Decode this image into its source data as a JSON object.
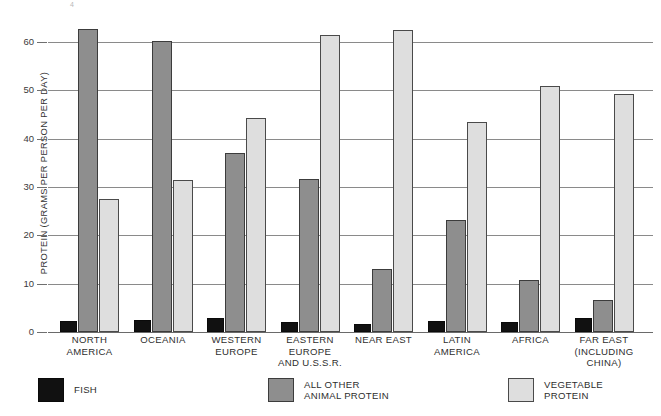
{
  "chart_data": {
    "type": "bar",
    "title": "",
    "subtitle": "",
    "xlabel": "",
    "ylabel": "PROTEIN (GRAMS PER PERSON PER DAY)",
    "ylim": [
      0,
      65
    ],
    "yticks": [
      0,
      10,
      20,
      30,
      40,
      50,
      60
    ],
    "ytick_labels": [
      "0",
      "10",
      "20",
      "30",
      "40",
      "50",
      "60"
    ],
    "grid": true,
    "legend_position": "bottom-left",
    "categories": [
      "NORTH\nAMERICA",
      "OCEANIA",
      "WESTERN\nEUROPE",
      "EASTERN\nEUROPE\nAND U.S.S.R.",
      "NEAR EAST",
      "LATIN\nAMERICA",
      "AFRICA",
      "FAR EAST\n(INCLUDING\nCHINA)"
    ],
    "series": [
      {
        "name": "FISH",
        "color": "#111111",
        "values": [
          2.3,
          2.4,
          2.8,
          2.0,
          1.7,
          2.2,
          2.1,
          3.0
        ]
      },
      {
        "name": "ALL OTHER\nANIMAL PROTEIN",
        "color": "#8e8e8e",
        "values": [
          62.7,
          60.2,
          37.1,
          31.7,
          13.0,
          23.1,
          10.8,
          6.6
        ]
      },
      {
        "name": "VEGETABLE\nPROTEIN",
        "color": "#dedede",
        "values": [
          27.5,
          31.5,
          44.3,
          61.5,
          62.5,
          43.5,
          50.8,
          49.2
        ]
      }
    ]
  },
  "axis": {
    "y_title": "PROTEIN (GRAMS PER PERSON PER DAY)",
    "ticks": [
      "0",
      "10",
      "20",
      "30",
      "40",
      "50",
      "60"
    ]
  },
  "legend": {
    "items": [
      {
        "label": "FISH",
        "color": "#111111"
      },
      {
        "label": "ALL OTHER\nANIMAL PROTEIN",
        "color": "#8e8e8e"
      },
      {
        "label": "VEGETABLE\nPROTEIN",
        "color": "#dedede"
      }
    ]
  },
  "categories": [
    "NORTH\nAMERICA",
    "OCEANIA",
    "WESTERN\nEUROPE",
    "EASTERN\nEUROPE\nAND U.S.S.R.",
    "NEAR EAST",
    "LATIN\nAMERICA",
    "AFRICA",
    "FAR EAST\n(INCLUDING\nCHINA)"
  ],
  "corner_mark": "4"
}
